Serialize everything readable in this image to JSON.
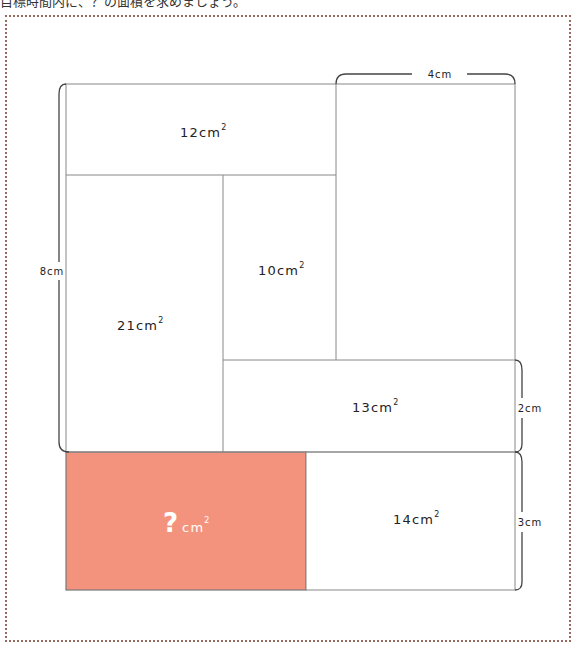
{
  "instruction": "目標時間内に、？の面積を求めましょう。",
  "colors": {
    "unknown_fill": "#f4937d",
    "line": "#777777",
    "frame_border": "#9a6a5e"
  },
  "regions": {
    "top_left": {
      "value": "12",
      "unit": "cm",
      "sup": "2"
    },
    "left_tall": {
      "value": "21",
      "unit": "cm",
      "sup": "2"
    },
    "middle": {
      "value": "10",
      "unit": "cm",
      "sup": "2"
    },
    "bottom_wide": {
      "value": "13",
      "unit": "cm",
      "sup": "2"
    },
    "bottom_right": {
      "value": "14",
      "unit": "cm",
      "sup": "2"
    },
    "unknown": {
      "value": "?",
      "unit": "cm",
      "sup": "2"
    }
  },
  "dimensions": {
    "top": "4cm",
    "left": "8cm",
    "right_upper": "2cm",
    "right_lower": "3cm"
  }
}
